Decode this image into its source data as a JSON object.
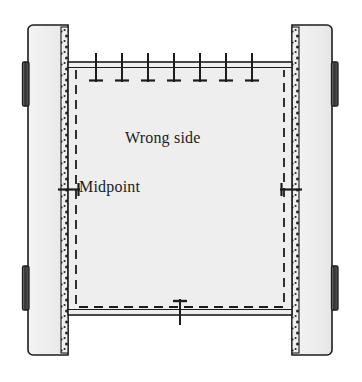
{
  "figure": {
    "name": "sewing-diagram-pinned-seam",
    "width": 362,
    "height": 382,
    "background": "#ffffff",
    "labels": {
      "wrong_side": "Wrong side",
      "midpoint": "Midpoint"
    },
    "colors": {
      "fabric_fill": "#eeeeee",
      "panel_fill": "#ededed",
      "outline": "#1c1c1c",
      "seam_dash": "#1c1c1c",
      "selvage_dot": "#2a2a2a",
      "tab_dark": "#3a3a3a",
      "background": "#ffffff"
    },
    "panels": [
      {
        "name": "left-panel",
        "x": 28,
        "y": 25,
        "width": 40,
        "height": 330
      },
      {
        "name": "right-panel",
        "x": 292,
        "y": 25,
        "width": 40,
        "height": 330
      }
    ],
    "selvages": [
      {
        "name": "left-selvage",
        "x": 61,
        "y": 30,
        "width": 7,
        "height": 320
      },
      {
        "name": "right-selvage",
        "x": 292,
        "y": 30,
        "width": 7,
        "height": 320
      }
    ],
    "tabs": [
      {
        "name": "left-tab-upper",
        "x": 22,
        "y": 62,
        "width": 7,
        "height": 44
      },
      {
        "name": "left-tab-lower",
        "x": 22,
        "y": 266,
        "width": 7,
        "height": 44
      },
      {
        "name": "right-tab-upper",
        "x": 332,
        "y": 62,
        "width": 7,
        "height": 44
      },
      {
        "name": "right-tab-lower",
        "x": 332,
        "y": 266,
        "width": 7,
        "height": 44
      }
    ],
    "fabric": {
      "name": "center-fabric",
      "x": 68,
      "y": 62,
      "width": 224,
      "height": 253
    },
    "seam_line": {
      "name": "seam-dashed-line",
      "x": 76,
      "y": 70,
      "width": 208,
      "height": 237,
      "dash": "8 6",
      "sides": "left-top-right-bottom"
    },
    "pins": {
      "top": {
        "count": 7,
        "y_edge": 63,
        "positions": [
          96,
          122,
          148,
          174,
          200,
          226,
          252
        ]
      },
      "midpoint_left": {
        "x": 68,
        "y": 190
      },
      "midpoint_right": {
        "x": 292,
        "y": 190
      },
      "bottom_center": {
        "x": 180,
        "y": 310
      }
    }
  }
}
